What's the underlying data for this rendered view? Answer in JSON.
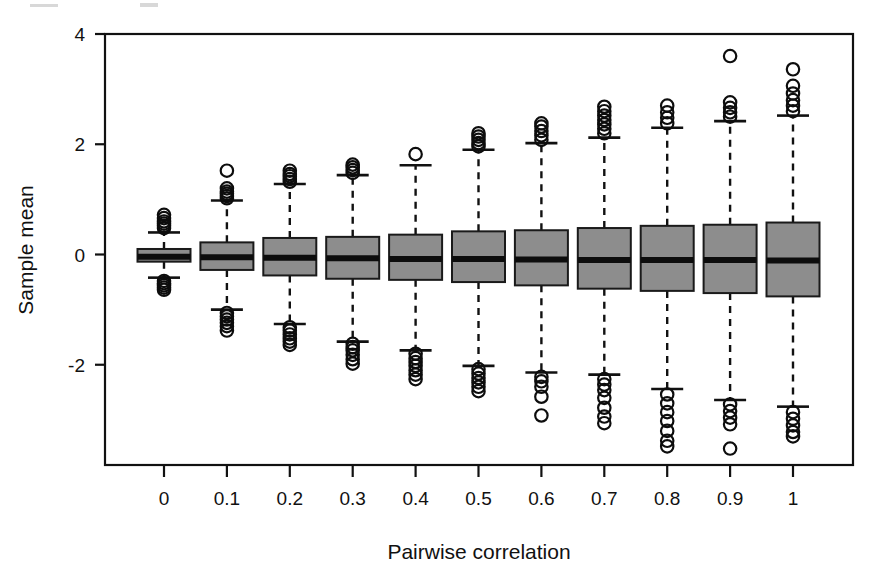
{
  "chart_data": {
    "type": "boxplot",
    "title": "",
    "xlabel": "Pairwise correlation",
    "ylabel": "Sample mean",
    "categories": [
      "0",
      "0.1",
      "0.2",
      "0.3",
      "0.4",
      "0.5",
      "0.6",
      "0.7",
      "0.8",
      "0.9",
      "1"
    ],
    "x_tick_labels": [
      "0",
      "0.1",
      "0.2",
      "0.3",
      "0.4",
      "0.5",
      "0.6",
      "0.7",
      "0.8",
      "0.9",
      "1"
    ],
    "y_tick_labels": [
      "4",
      "2",
      "0",
      "-2"
    ],
    "y_ticks": [
      4,
      2,
      0,
      -2
    ],
    "ylim": [
      -3.9,
      4.0
    ],
    "grid": false,
    "legend": null,
    "box_fill_color": "#8d8d8d",
    "line_color": "#111111",
    "background_color": "#ffffff",
    "boxes": [
      {
        "category": "0",
        "whisker_low": -0.42,
        "q1": -0.13,
        "median": -0.04,
        "q3": 0.1,
        "whisker_high": 0.4,
        "outliers_high": [
          0.48,
          0.52,
          0.56,
          0.6,
          0.66,
          0.72
        ],
        "outliers_low": [
          -0.48,
          -0.52,
          -0.56,
          -0.6,
          -0.64
        ]
      },
      {
        "category": "0.1",
        "whisker_low": -1.0,
        "q1": -0.28,
        "median": -0.05,
        "q3": 0.22,
        "whisker_high": 0.98,
        "outliers_high": [
          1.02,
          1.06,
          1.1,
          1.14,
          1.2,
          1.52
        ],
        "outliers_low": [
          -1.06,
          -1.12,
          -1.18,
          -1.24,
          -1.3,
          -1.38
        ]
      },
      {
        "category": "0.2",
        "whisker_low": -1.26,
        "q1": -0.38,
        "median": -0.06,
        "q3": 0.3,
        "whisker_high": 1.28,
        "outliers_high": [
          1.32,
          1.37,
          1.42,
          1.46,
          1.52
        ],
        "outliers_low": [
          -1.32,
          -1.38,
          -1.45,
          -1.52,
          -1.58,
          -1.64
        ]
      },
      {
        "category": "0.3",
        "whisker_low": -1.58,
        "q1": -0.44,
        "median": -0.07,
        "q3": 0.32,
        "whisker_high": 1.44,
        "outliers_high": [
          1.48,
          1.53,
          1.58,
          1.63
        ],
        "outliers_low": [
          -1.62,
          -1.68,
          -1.74,
          -1.82,
          -1.9,
          -1.98
        ]
      },
      {
        "category": "0.4",
        "whisker_low": -1.74,
        "q1": -0.46,
        "median": -0.08,
        "q3": 0.36,
        "whisker_high": 1.62,
        "outliers_high": [
          1.82
        ],
        "outliers_low": [
          -1.8,
          -1.88,
          -1.95,
          -2.02,
          -2.1,
          -2.18,
          -2.26
        ]
      },
      {
        "category": "0.5",
        "whisker_low": -2.02,
        "q1": -0.5,
        "median": -0.08,
        "q3": 0.42,
        "whisker_high": 1.9,
        "outliers_high": [
          1.96,
          2.02,
          2.08,
          2.14,
          2.2
        ],
        "outliers_low": [
          -2.08,
          -2.16,
          -2.24,
          -2.32,
          -2.4,
          -2.48
        ]
      },
      {
        "category": "0.6",
        "whisker_low": -2.14,
        "q1": -0.56,
        "median": -0.09,
        "q3": 0.44,
        "whisker_high": 2.02,
        "outliers_high": [
          2.08,
          2.16,
          2.24,
          2.32,
          2.38
        ],
        "outliers_low": [
          -2.22,
          -2.3,
          -2.4,
          -2.58,
          -2.92
        ]
      },
      {
        "category": "0.7",
        "whisker_low": -2.18,
        "q1": -0.62,
        "median": -0.1,
        "q3": 0.48,
        "whisker_high": 2.12,
        "outliers_high": [
          2.2,
          2.28,
          2.36,
          2.44,
          2.52,
          2.6,
          2.68
        ],
        "outliers_low": [
          -2.26,
          -2.36,
          -2.46,
          -2.6,
          -2.78,
          -2.94,
          -3.06
        ]
      },
      {
        "category": "0.8",
        "whisker_low": -2.44,
        "q1": -0.66,
        "median": -0.1,
        "q3": 0.52,
        "whisker_high": 2.3,
        "outliers_high": [
          2.38,
          2.48,
          2.58,
          2.7
        ],
        "outliers_low": [
          -2.54,
          -2.7,
          -2.86,
          -3.02,
          -3.2,
          -3.38,
          -3.48
        ]
      },
      {
        "category": "0.9",
        "whisker_low": -2.64,
        "q1": -0.7,
        "median": -0.1,
        "q3": 0.54,
        "whisker_high": 2.42,
        "outliers_high": [
          2.5,
          2.58,
          2.66,
          2.76,
          3.6
        ],
        "outliers_low": [
          -2.72,
          -2.84,
          -2.96,
          -3.08,
          -3.52
        ]
      },
      {
        "category": "1",
        "whisker_low": -2.76,
        "q1": -0.76,
        "median": -0.11,
        "q3": 0.58,
        "whisker_high": 2.52,
        "outliers_high": [
          2.6,
          2.7,
          2.8,
          2.92,
          3.06,
          3.36
        ],
        "outliers_low": [
          -2.86,
          -2.98,
          -3.1,
          -3.22,
          -3.3
        ]
      }
    ]
  },
  "axes": {
    "x_label": "Pairwise correlation",
    "y_label": "Sample mean"
  }
}
